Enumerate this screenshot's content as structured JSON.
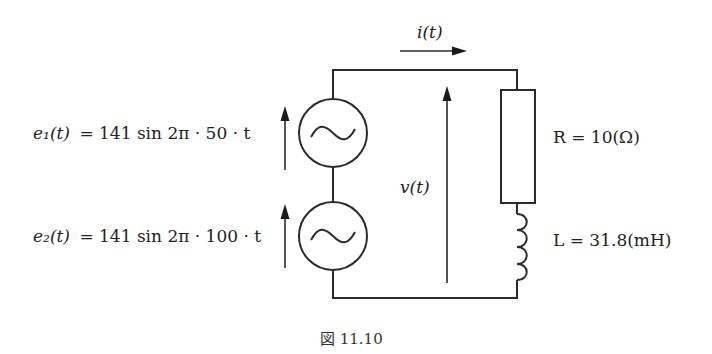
{
  "diagram": {
    "type": "circuit",
    "sources": [
      {
        "id": "e1",
        "label_lhs": "e₁(t)",
        "label_rhs": "= 141 sin 2π · 50 · t",
        "symbol": "ac-source-icon"
      },
      {
        "id": "e2",
        "label_lhs": "e₂(t)",
        "label_rhs": "= 141 sin 2π · 100 · t",
        "symbol": "ac-source-icon"
      }
    ],
    "current_label": "i(t)",
    "voltage_label": "v(t)",
    "resistor": {
      "label": "R = 10(Ω)"
    },
    "inductor": {
      "label": "L = 31.8(mH)"
    },
    "caption": "図 11.10"
  }
}
